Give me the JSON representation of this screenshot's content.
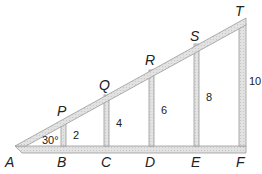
{
  "diagram": {
    "type": "truss",
    "colors": {
      "beam_fill": "#d9d9d9",
      "beam_stroke": "#9a9a9a",
      "text": "#222222"
    },
    "points": {
      "A": "A",
      "B": "B",
      "C": "C",
      "D": "D",
      "E": "E",
      "F": "F",
      "P": "P",
      "Q": "Q",
      "R": "R",
      "S": "S",
      "T": "T"
    },
    "angle_label": "30°",
    "post_heights": {
      "BP": "2",
      "CQ": "4",
      "DR": "6",
      "ES": "8",
      "FT": "10"
    }
  }
}
